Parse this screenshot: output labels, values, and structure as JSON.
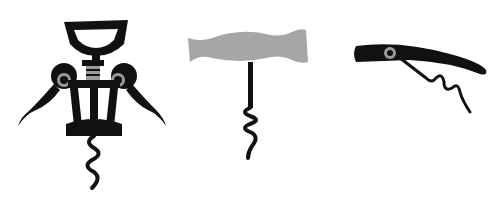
{
  "scene": {
    "description": "Three corkscrew silhouettes on white background",
    "background": "#ffffff",
    "colors": {
      "ink": "#111111",
      "gray": "#a6a6a6",
      "ring": "#9a9a9a"
    }
  },
  "figures": [
    {
      "name": "wing-corkscrew"
    },
    {
      "name": "t-handle-corkscrew"
    },
    {
      "name": "waiters-corkscrew"
    }
  ]
}
